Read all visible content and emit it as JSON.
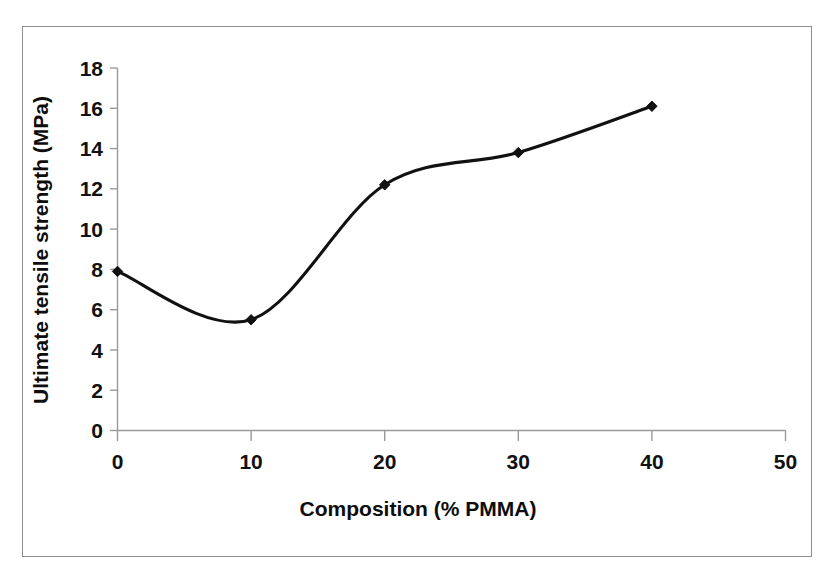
{
  "chart_data": {
    "type": "line",
    "title": "",
    "subtitle": "",
    "xlabel": "Composition (% PMMA)",
    "ylabel": "Ultimate tensile strength (MPa)",
    "x": [
      0,
      10,
      20,
      30,
      40
    ],
    "values": [
      7.9,
      5.5,
      12.2,
      13.8,
      16.1
    ],
    "series": [
      {
        "name": "Ultimate tensile strength",
        "x": [
          0,
          10,
          20,
          30,
          40
        ],
        "values": [
          7.9,
          5.5,
          12.2,
          13.8,
          16.1
        ]
      }
    ],
    "xlim": [
      0,
      50
    ],
    "ylim": [
      0,
      18
    ],
    "xticks": [
      "0",
      "10",
      "20",
      "30",
      "40",
      "50"
    ],
    "yticks": [
      "0",
      "2",
      "4",
      "6",
      "8",
      "10",
      "12",
      "14",
      "16",
      "18"
    ],
    "xtick_values": [
      0,
      10,
      20,
      30,
      40,
      50
    ],
    "ytick_values": [
      0,
      2,
      4,
      6,
      8,
      10,
      12,
      14,
      16,
      18
    ],
    "grid": false,
    "legend": false,
    "legend_position": "none",
    "smoothed": true,
    "marker": "diamond",
    "line_color": "#111111",
    "marker_color": "#111111",
    "axis_color": "#9a9a9a",
    "background_color": "#ffffff",
    "border_color": "#8d8d8d",
    "annotations": []
  }
}
